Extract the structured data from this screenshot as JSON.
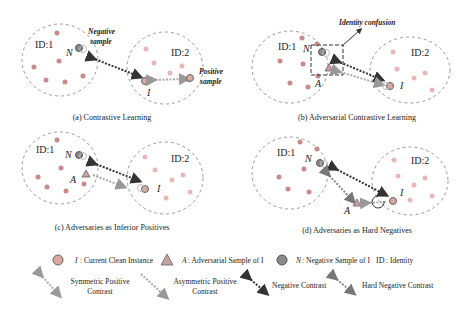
{
  "panels": [
    {
      "id": "a",
      "caption": "(a) Contrastive Learning",
      "id1_label": "ID:1",
      "id2_label": "ID:2",
      "n_label": "N",
      "i_label": "I",
      "negative_sample_label_1": "Negative",
      "negative_sample_label_2": "sample",
      "positive_sample_label_1": "Positive",
      "positive_sample_label_2": "sample"
    },
    {
      "id": "b",
      "caption": "(b) Adversarial Contrastive Learning",
      "id1_label": "ID:1",
      "id2_label": "ID:2",
      "n_label": "N",
      "a_label": "A",
      "i_label": "I",
      "annotation": "Identity confusion"
    },
    {
      "id": "c",
      "caption": "(c) Adversaries as Inferior Positives",
      "id1_label": "ID:1",
      "id2_label": "ID:2",
      "n_label": "N",
      "a_label": "A",
      "i_label": "I"
    },
    {
      "id": "d",
      "caption": "(d) Adversaries as Hard Negatives",
      "id1_label": "ID:1",
      "id2_label": "ID:2",
      "n_label": "N",
      "a_label": "A",
      "i_label": "I"
    }
  ],
  "legend": {
    "row1": [
      {
        "symbol": "circle-light",
        "key": "I",
        "text": ": Current Clean Instance"
      },
      {
        "symbol": "triangle",
        "key": "A",
        "text": ": Adversarial Sample of I"
      },
      {
        "symbol": "circle-dark",
        "key": "N",
        "text": ": Negative Sample of I"
      },
      {
        "symbol": "none",
        "key": "ID",
        "text": ": Identity"
      }
    ],
    "row2": [
      {
        "symbol": "symmetric-positive-arrow",
        "text_1": "Symmetric Positive",
        "text_2": "Contrast"
      },
      {
        "symbol": "asymmetric-positive-arrow",
        "text_1": "Asymmetric Positive",
        "text_2": "Contrast"
      },
      {
        "symbol": "negative-arrow",
        "text_1": "Negative Contrast"
      },
      {
        "symbol": "hard-negative-arrow",
        "text_1": "Hard Negative Contrast"
      }
    ]
  },
  "colors": {
    "id1_dot": "#c98a8a",
    "id2_dot": "#e8b8b8",
    "negative_dot": "#8a8a8a",
    "clean_instance_fill": "#d9a8a0",
    "adversarial_fill": "#c9a0a0",
    "negative_arrow": "#333333",
    "positive_arrow": "#aaaaaa",
    "dashed_circle": "#999999"
  }
}
